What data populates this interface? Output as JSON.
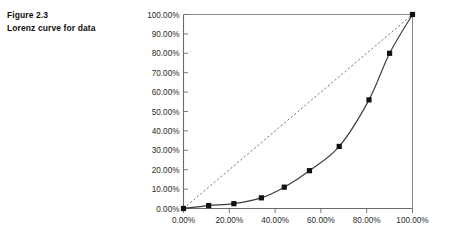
{
  "caption": {
    "line1": "Figure 2.3",
    "line2": "Lorenz curve for data"
  },
  "chart_data": {
    "type": "line",
    "title": "Lorenz curve for data",
    "xlabel": "",
    "ylabel": "",
    "xlim": [
      0,
      100
    ],
    "ylim": [
      0,
      100
    ],
    "grid": false,
    "legend": "none",
    "x_tick_labels": [
      "0.00%",
      "20.00%",
      "40.00%",
      "60.00%",
      "80.00%",
      "100.00%"
    ],
    "x_ticks": [
      0,
      20,
      40,
      60,
      80,
      100
    ],
    "y_tick_labels": [
      "0.00%",
      "10.00%",
      "20.00%",
      "30.00%",
      "40.00%",
      "50.00%",
      "60.00%",
      "70.00%",
      "80.00%",
      "90.00%",
      "100.00%"
    ],
    "y_ticks": [
      0,
      10,
      20,
      30,
      40,
      50,
      60,
      70,
      80,
      90,
      100
    ],
    "series": [
      {
        "name": "Lorenz curve",
        "marker": "square",
        "color": "#111111",
        "x": [
          0,
          11,
          22,
          34,
          44,
          55,
          68,
          81,
          90,
          100
        ],
        "y": [
          0,
          1.5,
          2.5,
          5.5,
          11,
          19.5,
          32,
          56,
          80,
          100
        ]
      },
      {
        "name": "Line of equality",
        "marker": "none",
        "style": "dashed",
        "color": "#555555",
        "x": [
          0,
          100
        ],
        "y": [
          0,
          100
        ]
      }
    ]
  },
  "colors": {
    "axis": "#6b6b6b",
    "curve": "#3a3a3a",
    "marker": "#111111",
    "equality": "#666666"
  }
}
